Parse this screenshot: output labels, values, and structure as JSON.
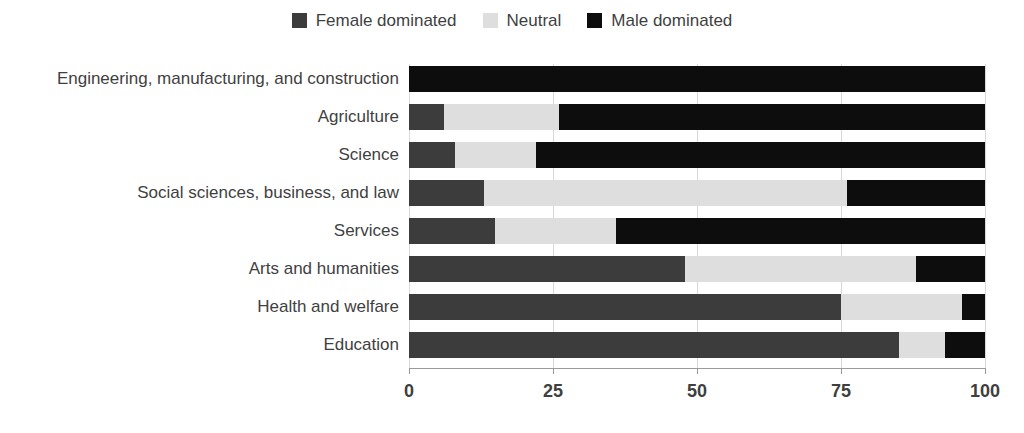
{
  "chart_data": {
    "type": "bar",
    "subtype": "horizontal-stacked-100",
    "title": "",
    "xlabel": "",
    "ylabel": "",
    "xlim": [
      0,
      100
    ],
    "xticks": [
      "0",
      "25",
      "50",
      "75",
      "100"
    ],
    "xtick_values": [
      0,
      25,
      50,
      75,
      100
    ],
    "grid": true,
    "grid_axis": "x",
    "legend_position": "top-center",
    "stack_order": [
      "Female dominated",
      "Neutral",
      "Male dominated"
    ],
    "categories": [
      "Engineering, manufacturing, and construction",
      "Agriculture",
      "Science",
      "Social sciences, business, and law",
      "Services",
      "Arts and humanities",
      "Health and welfare",
      "Education"
    ],
    "series": [
      {
        "name": "Female dominated",
        "color": "#3c3c3c",
        "values": [
          0,
          6,
          8,
          13,
          15,
          48,
          75,
          85
        ]
      },
      {
        "name": "Neutral",
        "color": "#dedede",
        "values": [
          0,
          20,
          14,
          63,
          21,
          40,
          21,
          8
        ]
      },
      {
        "name": "Male dominated",
        "color": "#0d0d0d",
        "values": [
          100,
          74,
          78,
          24,
          64,
          12,
          4,
          7
        ]
      }
    ]
  },
  "legend": {
    "items": [
      {
        "label": "Female dominated",
        "color": "#3c3c3c"
      },
      {
        "label": "Neutral",
        "color": "#dedede"
      },
      {
        "label": "Male dominated",
        "color": "#0d0d0d"
      }
    ]
  },
  "axis": {
    "x_tick_labels": [
      "0",
      "25",
      "50",
      "75",
      "100"
    ]
  },
  "colors": {
    "female_dominated": "#3c3c3c",
    "neutral": "#dedede",
    "male_dominated": "#0d0d0d",
    "text": "#3f3f3f",
    "gridline": "#d8d8d8",
    "axis": "#9a9a9a",
    "background": "#ffffff"
  }
}
